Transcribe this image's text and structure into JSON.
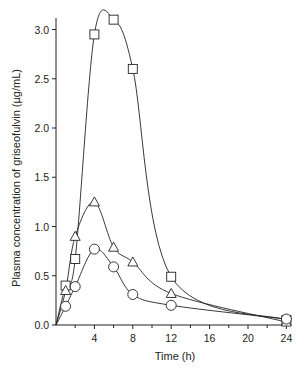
{
  "chart_data": {
    "type": "line",
    "title": "",
    "xlabel": "Time (h)",
    "ylabel": "Plasma concentration of griseofulvin (µg/mL)",
    "xlim": [
      0,
      24.5
    ],
    "ylim": [
      0,
      3.2
    ],
    "xticks": [
      4,
      8,
      12,
      16,
      20,
      24
    ],
    "xminor_ticks": [
      2,
      6,
      10,
      14,
      18,
      22
    ],
    "yticks": [
      0.0,
      0.5,
      1.0,
      1.5,
      2.0,
      2.5,
      3.0
    ],
    "ytick_labels": [
      "0.0",
      "0.5",
      "1.0",
      "1.5",
      "2.0",
      "2.5",
      "3.0"
    ],
    "grid": false,
    "legend": null,
    "series": [
      {
        "name": "square-series",
        "marker": "square",
        "x": [
          0,
          1,
          2,
          4,
          6,
          8,
          12,
          24
        ],
        "y": [
          0,
          0.4,
          0.67,
          2.95,
          3.1,
          2.6,
          0.49,
          0.05
        ]
      },
      {
        "name": "triangle-series",
        "marker": "triangle",
        "x": [
          0,
          1,
          2,
          4,
          6,
          8,
          12,
          24
        ],
        "y": [
          0,
          0.35,
          0.9,
          1.25,
          0.79,
          0.64,
          0.32,
          0.03
        ]
      },
      {
        "name": "circle-series",
        "marker": "circle",
        "x": [
          0,
          1,
          2,
          4,
          6,
          8,
          12,
          24
        ],
        "y": [
          0,
          0.19,
          0.39,
          0.77,
          0.59,
          0.31,
          0.2,
          0.06
        ]
      }
    ]
  },
  "colors": {
    "axis": "#222222",
    "line": "#222222",
    "marker_fill": "#ffffff"
  }
}
